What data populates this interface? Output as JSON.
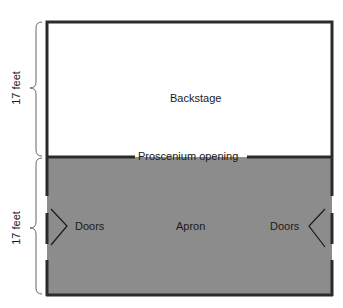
{
  "diagram": {
    "regions": {
      "backstage": "Backstage",
      "apron": "Apron",
      "proscenium": "Proscenium opening",
      "doors_left": "Doors",
      "doors_right": "Doors"
    },
    "dimensions": {
      "top": "17 feet",
      "bottom": "17 feet"
    },
    "colors": {
      "apron_fill": "#8c8c8c",
      "wall": "#2b2b2b",
      "backstage_fill": "#ffffff"
    }
  }
}
